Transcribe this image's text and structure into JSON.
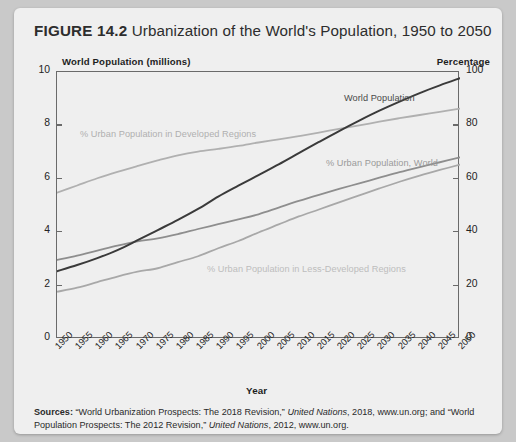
{
  "figure": {
    "number": "FIGURE 14.2",
    "title": "Urbanization of the World's Population, 1950 to 2050"
  },
  "sources": {
    "label": "Sources:",
    "text_1": " “World Urbanization Prospects: The 2018 Revision,” ",
    "italic_1": "United Nations",
    "text_2": ", 2018, www.un.org; and “World Population Prospects: The 2012 Revision,” ",
    "italic_2": "United Nations",
    "text_3": ", 2012, www.un.org."
  },
  "colors": {
    "card_background": "#efefef",
    "page_background": "#c9c9c9",
    "axis": "#6a6a6a",
    "world_population_line": "#3a3a3a",
    "developed_line": "#b0b0b0",
    "world_urban_line": "#8e8e8e",
    "less_developed_line": "#a8a8a8",
    "heading_text": "#2d2d2d"
  },
  "chart_data": {
    "type": "line",
    "title": "Urbanization of the World's Population, 1950 to 2050",
    "xlabel": "Year",
    "ylabel": "World Population (millions)",
    "y2label": "Percentage",
    "ylim": [
      0,
      10
    ],
    "y2lim": [
      0,
      100
    ],
    "grid": false,
    "legend_position": "in-plot-labels",
    "yticks_left": [
      "0",
      "2",
      "4",
      "6",
      "8",
      "10"
    ],
    "yticks_right": [
      "0",
      "20",
      "40",
      "60",
      "80",
      "100"
    ],
    "x": [
      "1950",
      "1955",
      "1960",
      "1965",
      "1970",
      "1975",
      "1980",
      "1985",
      "1990",
      "1995",
      "2000",
      "2005",
      "2010",
      "2015",
      "2020",
      "2025",
      "2030",
      "2035",
      "2040",
      "2045",
      "2050"
    ],
    "series": [
      {
        "name": "World Population",
        "axis": "left",
        "units": "billions plotted on 0-10 scale",
        "color": "#3a3a3a",
        "width": 2.0,
        "values": [
          2.54,
          2.77,
          3.03,
          3.33,
          3.7,
          4.08,
          4.46,
          4.87,
          5.33,
          5.74,
          6.14,
          6.54,
          6.96,
          7.38,
          7.79,
          8.18,
          8.55,
          8.89,
          9.21,
          9.5,
          9.77
        ]
      },
      {
        "name": "% Urban Population in Developed Regions",
        "axis": "right",
        "color": "#b0b0b0",
        "width": 1.8,
        "values": [
          54.8,
          57.5,
          60.2,
          62.6,
          64.8,
          66.9,
          68.8,
          70.2,
          71.2,
          72.3,
          73.6,
          74.8,
          76.0,
          77.3,
          78.7,
          80.0,
          81.4,
          82.7,
          83.9,
          85.1,
          86.3
        ]
      },
      {
        "name": "% Urban Population, World",
        "axis": "right",
        "color": "#8e8e8e",
        "width": 1.8,
        "values": [
          29.6,
          31.2,
          33.1,
          35.0,
          36.6,
          37.7,
          39.3,
          41.2,
          43.0,
          44.8,
          46.7,
          49.2,
          51.7,
          54.0,
          56.2,
          58.3,
          60.4,
          62.5,
          64.4,
          66.2,
          68.0
        ]
      },
      {
        "name": "% Urban Population in Less-Developed Regions",
        "axis": "right",
        "color": "#a8a8a8",
        "width": 1.8,
        "values": [
          17.7,
          19.2,
          21.3,
          23.4,
          25.2,
          26.5,
          28.8,
          31.0,
          34.0,
          36.7,
          39.9,
          42.9,
          45.9,
          48.5,
          51.2,
          53.8,
          56.4,
          58.9,
          61.2,
          63.3,
          65.3
        ]
      }
    ],
    "annotations": [
      {
        "text": "World Population",
        "x": "2030",
        "y": 8.9
      },
      {
        "text": "% Urban Population in Developed Regions",
        "x": "1962",
        "y": 8.0
      },
      {
        "text": "% Urban Population, World",
        "x": "2015",
        "y": 6.6
      },
      {
        "text": "% Urban Population in Less-Developed Regions",
        "x": "1988",
        "y": 2.8
      }
    ]
  }
}
